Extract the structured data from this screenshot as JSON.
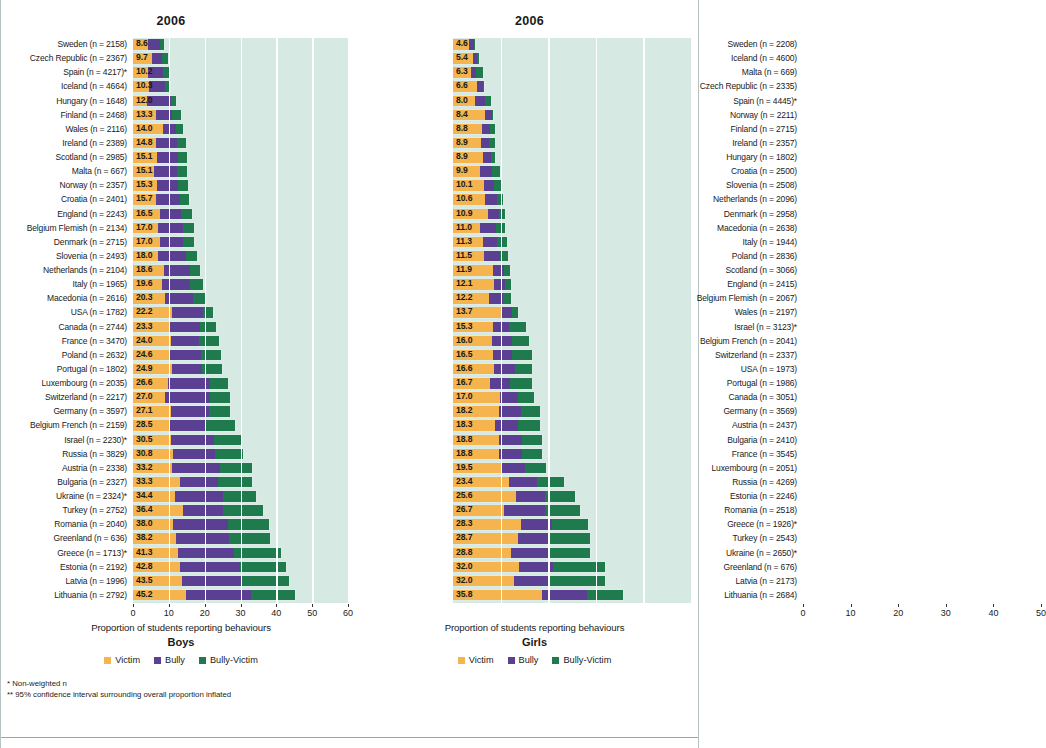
{
  "colors": {
    "victim": "#f5b44d",
    "bully": "#5b3f93",
    "bully_victim": "#1f7a4d",
    "plot_background": "#d7e9e3",
    "gridline": "#ffffff"
  },
  "legend": {
    "victim_label": "Victim",
    "bully_label": "Bully",
    "bully_victim_label": "Bully-Victim"
  },
  "footnotes": {
    "line1": "* Non-weighted n",
    "line2": "** 95% confidence interval surrounding overall proportion inflated"
  },
  "boys": {
    "year": "2006",
    "sex_title": "Boys",
    "axis_title": "Proportion of students reporting behaviours"
  },
  "girls": {
    "year": "2006",
    "sex_title": "Girls",
    "axis_title": "Proportion of students reporting behaviours"
  },
  "chart_data": [
    {
      "type": "bar",
      "orientation": "horizontal",
      "stacked": true,
      "title": "2006",
      "subtitle": "Boys",
      "xlabel": "Proportion of students reporting behaviours",
      "ylabel": "",
      "xlim": [
        0,
        60
      ],
      "xticks": [
        0,
        10,
        20,
        30,
        40,
        50,
        60
      ],
      "grid": true,
      "legend": [
        "Victim",
        "Bully",
        "Bully-Victim"
      ],
      "legend_position": "bottom",
      "categories": [
        "Sweden (n = 2158)",
        "Czech Republic (n = 2367)",
        "Spain (n = 4217)*",
        "Iceland (n = 4664)",
        "Hungary (n = 1648)",
        "Finland (n = 2468)",
        "Wales (n = 2116)",
        "Ireland (n = 2389)",
        "Scotland (n = 2985)",
        "Malta (n = 667)",
        "Norway (n = 2357)",
        "Croatia (n = 2401)",
        "England (n = 2243)",
        "Belgium Flemish (n = 2134)",
        "Denmark (n = 2715)",
        "Slovenia (n = 2493)",
        "Netherlands (n = 2104)",
        "Italy (n = 1965)",
        "Macedonia (n = 2616)",
        "USA (n = 1782)",
        "Canada (n = 2744)",
        "France (n = 3470)",
        "Poland (n = 2632)",
        "Portugal (n = 1802)",
        "Luxembourg (n = 2035)",
        "Switzerland (n = 2217)",
        "Germany (n = 3597)",
        "Belgium French (n = 2159)",
        "Israel (n = 2230)*",
        "Russia (n = 3829)",
        "Austria (n = 2338)",
        "Bulgaria (n = 2327)",
        "Ukraine (n = 2324)*",
        "Turkey (n = 2752)",
        "Romania (n = 2040)",
        "Greenland (n = 636)",
        "Greece (n = 1713)*",
        "Estonia (n = 2192)",
        "Latvia (n = 1996)",
        "Lithuania (n = 2792)"
      ],
      "totals": [
        8.6,
        9.7,
        10.2,
        10.3,
        12.0,
        13.3,
        14.0,
        14.8,
        15.1,
        15.1,
        15.3,
        15.7,
        16.5,
        17.0,
        17.0,
        18.0,
        18.6,
        19.6,
        20.3,
        22.2,
        23.3,
        24.0,
        24.6,
        24.9,
        26.6,
        27.0,
        27.1,
        28.5,
        30.5,
        30.8,
        33.2,
        33.3,
        34.4,
        36.4,
        38.0,
        38.2,
        41.3,
        42.8,
        43.5,
        45.2
      ],
      "series": [
        {
          "name": "Victim",
          "values": [
            4.2,
            5.2,
            4.1,
            4.6,
            4.0,
            6.4,
            8.5,
            6.5,
            6.6,
            5.8,
            6.6,
            6.5,
            7.4,
            7.1,
            7.4,
            6.9,
            8.7,
            8.2,
            8.9,
            10.9,
            10.4,
            10.6,
            10.0,
            11.0,
            9.9,
            9.0,
            10.6,
            10.2,
            10.6,
            11.3,
            11.0,
            13.1,
            11.8,
            14.0,
            11.2,
            11.9,
            12.6,
            13.1,
            13.8,
            14.8
          ]
        },
        {
          "name": "Bully",
          "values": [
            3.2,
            3.0,
            4.4,
            4.2,
            6.5,
            4.5,
            3.5,
            5.9,
            6.0,
            6.5,
            6.0,
            6.5,
            6.1,
            6.9,
            6.5,
            7.9,
            7.2,
            7.8,
            7.8,
            8.6,
            8.2,
            7.9,
            9.0,
            8.2,
            11.5,
            12.6,
            10.7,
            10.2,
            11.9,
            11.6,
            13.3,
            10.7,
            13.3,
            11.0,
            15.2,
            14.8,
            15.5,
            16.8,
            16.3,
            18.2
          ]
        },
        {
          "name": "Bully-Victim",
          "values": [
            1.2,
            1.5,
            1.7,
            1.5,
            1.5,
            2.4,
            2.0,
            2.4,
            2.5,
            2.8,
            2.7,
            2.7,
            3.0,
            3.0,
            3.1,
            3.2,
            2.7,
            3.6,
            3.6,
            2.7,
            4.7,
            5.5,
            5.6,
            5.7,
            5.2,
            5.4,
            5.8,
            8.1,
            8.0,
            7.9,
            8.9,
            9.5,
            9.3,
            11.4,
            11.6,
            11.5,
            13.2,
            12.9,
            13.4,
            12.2
          ]
        }
      ]
    },
    {
      "type": "bar",
      "orientation": "horizontal",
      "stacked": true,
      "title": "2006",
      "subtitle": "Girls",
      "xlabel": "Proportion of students reporting behaviours",
      "ylabel": "",
      "xlim": [
        0,
        50
      ],
      "xticks": [
        0,
        10,
        20,
        30,
        40,
        50
      ],
      "grid": true,
      "legend": [
        "Victim",
        "Bully",
        "Bully-Victim"
      ],
      "legend_position": "bottom",
      "categories": [
        "Sweden (n = 2208)",
        "Iceland (n = 4600)",
        "Malta (n = 669)",
        "Czech Republic (n = 2335)",
        "Spain (n = 4445)*",
        "Norway (n = 2211)",
        "Finland (n = 2715)",
        "Ireland (n = 2357)",
        "Hungary (n = 1802)",
        "Croatia (n = 2500)",
        "Slovenia (n = 2508)",
        "Netherlands (n = 2096)",
        "Denmark (n = 2958)",
        "Macedonia (n = 2638)",
        "Italy (n = 1944)",
        "Poland (n = 2836)",
        "Scotland (n = 3066)",
        "England (n = 2415)",
        "Belgium Flemish (n = 2067)",
        "Wales (n = 2197)",
        "Israel (n = 3123)*",
        "Belgium French (n = 2041)",
        "Switzerland (n = 2337)",
        "USA (n = 1973)",
        "Portugal (n = 1986)",
        "Canada (n = 3051)",
        "Germany (n = 3569)",
        "Austria (n = 2437)",
        "Bulgaria (n = 2410)",
        "France (n = 3545)",
        "Luxembourg (n = 2051)",
        "Russia (n = 4269)",
        "Estonia (n = 2246)",
        "Romania (n = 2518)",
        "Greece (n = 1926)*",
        "Turkey (n = 2543)",
        "Ukraine (n = 2650)*",
        "Greenland (n = 676)",
        "Latvia (n = 2173)",
        "Lithuania (n = 2684)"
      ],
      "totals": [
        4.6,
        5.4,
        6.3,
        6.6,
        8.0,
        8.4,
        8.8,
        8.9,
        8.9,
        9.9,
        10.1,
        10.6,
        10.9,
        11.0,
        11.3,
        11.5,
        11.9,
        12.1,
        12.2,
        13.7,
        15.3,
        16.0,
        16.5,
        16.6,
        16.7,
        17.0,
        18.2,
        18.3,
        18.8,
        18.8,
        19.5,
        23.4,
        25.6,
        26.7,
        28.3,
        28.7,
        28.8,
        32.0,
        32.0,
        35.8
      ],
      "series": [
        {
          "name": "Victim",
          "values": [
            3.4,
            4.2,
            3.7,
            5.0,
            4.7,
            6.7,
            6.0,
            5.8,
            6.2,
            5.6,
            6.5,
            6.8,
            7.3,
            5.6,
            6.2,
            6.6,
            8.4,
            8.7,
            7.6,
            10.0,
            8.3,
            8.2,
            8.4,
            8.6,
            7.7,
            9.8,
            9.7,
            8.8,
            9.6,
            9.7,
            10.3,
            11.7,
            13.3,
            10.8,
            14.2,
            13.7,
            12.2,
            13.9,
            12.8,
            18.7
          ]
        },
        {
          "name": "Bully",
          "values": [
            1.0,
            0.9,
            1.2,
            1.3,
            2.1,
            1.4,
            1.8,
            1.8,
            1.7,
            2.6,
            2.2,
            2.5,
            2.4,
            3.4,
            3.1,
            3.2,
            2.3,
            2.3,
            2.9,
            2.4,
            3.4,
            4.1,
            4.0,
            4.4,
            4.2,
            3.9,
            4.5,
            4.9,
            4.8,
            4.7,
            4.9,
            5.9,
            6.0,
            8.6,
            6.6,
            6.4,
            8.0,
            7.1,
            7.6,
            9.4
          ]
        },
        {
          "name": "Bully-Victim",
          "values": [
            0.2,
            0.3,
            1.4,
            0.3,
            1.2,
            0.3,
            1.0,
            1.3,
            1.0,
            1.7,
            1.4,
            1.3,
            1.2,
            2.0,
            2.0,
            1.7,
            1.2,
            1.1,
            1.7,
            1.3,
            3.6,
            3.7,
            4.1,
            3.6,
            4.8,
            3.3,
            4.0,
            4.6,
            4.4,
            4.4,
            4.3,
            5.8,
            6.3,
            7.3,
            7.5,
            8.6,
            8.6,
            11.0,
            11.6,
            7.7
          ]
        }
      ]
    }
  ]
}
